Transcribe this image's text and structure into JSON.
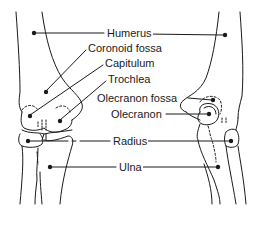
{
  "diagram": {
    "line_color": "#1a1a1a",
    "background": "#ffffff",
    "views": [
      {
        "name": "anterior-view",
        "position": "left"
      },
      {
        "name": "posterior-view",
        "position": "right"
      }
    ],
    "labels": [
      {
        "id": "humerus",
        "text": "Humerus"
      },
      {
        "id": "coronoid_fossa",
        "text": "Coronoid fossa"
      },
      {
        "id": "capitulum",
        "text": "Capitulum"
      },
      {
        "id": "trochlea",
        "text": "Trochlea"
      },
      {
        "id": "olecranon_fossa",
        "text": "Olecranon fossa"
      },
      {
        "id": "olecranon",
        "text": "Olecranon"
      },
      {
        "id": "radius",
        "text": "Radius"
      },
      {
        "id": "ulna",
        "text": "Ulna"
      }
    ]
  }
}
